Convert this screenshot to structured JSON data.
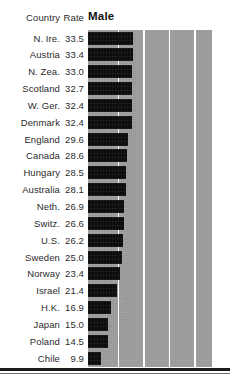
{
  "header": {
    "country_label": "Country",
    "rate_label": "Rate",
    "series_label": "Male"
  },
  "chart_data": {
    "type": "bar",
    "title": "Male",
    "xlabel": "",
    "ylabel": "",
    "orientation": "horizontal",
    "grid": true,
    "gridlines_at": [
      22,
      41,
      60,
      79
    ],
    "xlim": [
      0,
      92
    ],
    "legend": "none",
    "categories": [
      "N. Ire.",
      "Austria",
      "N. Zea.",
      "Scotland",
      "W. Ger.",
      "Denmark",
      "England",
      "Canada",
      "Hungary",
      "Australia",
      "Neth.",
      "Switz.",
      "U.S.",
      "Sweden",
      "Norway",
      "Israel",
      "H.K.",
      "Japan",
      "Poland",
      "Chile"
    ],
    "values": [
      33.5,
      33.4,
      33.0,
      32.7,
      32.4,
      32.4,
      29.6,
      28.6,
      28.5,
      28.1,
      26.9,
      26.6,
      26.2,
      25.0,
      23.4,
      21.4,
      16.9,
      15.0,
      14.5,
      9.9
    ],
    "bar_color": "#0b0b0b",
    "panel_color": "#9d9d9d",
    "gridline_color": "#ffffff"
  },
  "rows": [
    {
      "country": "N. Ire.",
      "rate": "33.5",
      "value": 33.5
    },
    {
      "country": "Austria",
      "rate": "33.4",
      "value": 33.4
    },
    {
      "country": "N. Zea.",
      "rate": "33.0",
      "value": 33.0
    },
    {
      "country": "Scotland",
      "rate": "32.7",
      "value": 32.7
    },
    {
      "country": "W. Ger.",
      "rate": "32.4",
      "value": 32.4
    },
    {
      "country": "Denmark",
      "rate": "32.4",
      "value": 32.4
    },
    {
      "country": "England",
      "rate": "29.6",
      "value": 29.6
    },
    {
      "country": "Canada",
      "rate": "28.6",
      "value": 28.6
    },
    {
      "country": "Hungary",
      "rate": "28.5",
      "value": 28.5
    },
    {
      "country": "Australia",
      "rate": "28.1",
      "value": 28.1
    },
    {
      "country": "Neth.",
      "rate": "26.9",
      "value": 26.9
    },
    {
      "country": "Switz.",
      "rate": "26.6",
      "value": 26.6
    },
    {
      "country": "U.S.",
      "rate": "26.2",
      "value": 26.2
    },
    {
      "country": "Sweden",
      "rate": "25.0",
      "value": 25.0
    },
    {
      "country": "Norway",
      "rate": "23.4",
      "value": 23.4
    },
    {
      "country": "Israel",
      "rate": "21.4",
      "value": 21.4
    },
    {
      "country": "H.K.",
      "rate": "16.9",
      "value": 16.9
    },
    {
      "country": "Japan",
      "rate": "15.0",
      "value": 15.0
    },
    {
      "country": "Poland",
      "rate": "14.5",
      "value": 14.5
    },
    {
      "country": "Chile",
      "rate": "9.9",
      "value": 9.9
    }
  ]
}
